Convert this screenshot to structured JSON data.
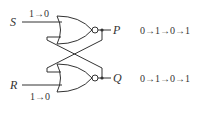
{
  "diagram": {
    "type": "sr-latch-nor",
    "inputs": {
      "S": {
        "name": "S",
        "transition": "1→0"
      },
      "R": {
        "name": "R",
        "transition": "1→0"
      }
    },
    "outputs": {
      "P": {
        "name": "P",
        "sequence": "0→1→0→1"
      },
      "Q": {
        "name": "Q",
        "sequence": "0→1→0→1"
      }
    },
    "gates": [
      {
        "id": "top-nor",
        "kind": "NOR",
        "inputs": [
          "S",
          "Q"
        ],
        "output": "P"
      },
      {
        "id": "bottom-nor",
        "kind": "NOR",
        "inputs": [
          "P",
          "R"
        ],
        "output": "Q"
      }
    ],
    "colors": {
      "line": "#333333",
      "background": "#ffffff"
    }
  }
}
